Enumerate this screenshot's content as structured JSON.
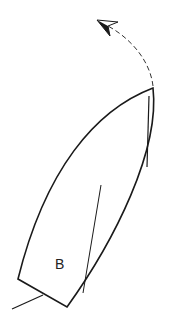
{
  "diagram": {
    "type": "sailing-boat-turn",
    "boat_label": "B",
    "arrow_style": "dashed-curved",
    "colors": {
      "stroke": "#1a1a1a",
      "background": "#ffffff"
    }
  }
}
